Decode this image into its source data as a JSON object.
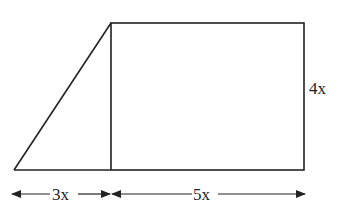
{
  "figure": {
    "labels": {
      "left_width": "3x",
      "right_width": "5x",
      "height": "4x"
    },
    "shapes": [
      "right triangle",
      "rectangle"
    ],
    "line_color": "#222222"
  }
}
